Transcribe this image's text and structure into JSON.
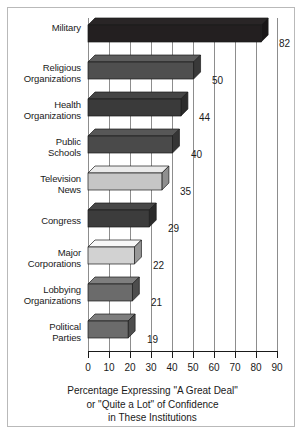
{
  "chart_data": {
    "type": "bar",
    "orientation": "horizontal",
    "title": "",
    "subtitle": "",
    "xlabel": "Percentage Expressing \"A Great Deal\"\nor \"Quite a Lot\" of Confidence\nin These Institutions",
    "ylabel": "",
    "xlim": [
      0,
      90
    ],
    "ylim": null,
    "grid": true,
    "legend": false,
    "xticks": [
      "0",
      "10",
      "20",
      "30",
      "40",
      "50",
      "60",
      "70",
      "80",
      "90"
    ],
    "xtick_values": [
      0,
      10,
      20,
      30,
      40,
      50,
      60,
      70,
      80,
      90
    ],
    "categories": [
      "Military",
      "Religious\nOrganizations",
      "Health\nOrganizations",
      "Public\nSchools",
      "Television\nNews",
      "Congress",
      "Major\nCorporations",
      "Lobbying\nOrganizations",
      "Political\nParties"
    ],
    "values": [
      82,
      50,
      44,
      40,
      35,
      29,
      22,
      21,
      19
    ],
    "value_labels": [
      "82",
      "50",
      "44",
      "40",
      "35",
      "29",
      "22",
      "21",
      "19"
    ],
    "bar_colors": [
      "#231f20",
      "#4f4f4f",
      "#3a3a3a",
      "#4a4a4a",
      "#c6c6c6",
      "#3c3c3c",
      "#d2d2d2",
      "#6b6b6b",
      "#6b6b6b"
    ]
  },
  "axis_title": {
    "line1": "Percentage Expressing \"A Great Deal\"",
    "line2": "or \"Quite a Lot\" of Confidence",
    "line3": "in These Institutions"
  },
  "colors": {
    "frame_border": "#b9b9b9",
    "gridline": "#8d8d8d",
    "axis": "#1a1a1a",
    "background": "#ffffff",
    "text": "#1a1a1a"
  }
}
